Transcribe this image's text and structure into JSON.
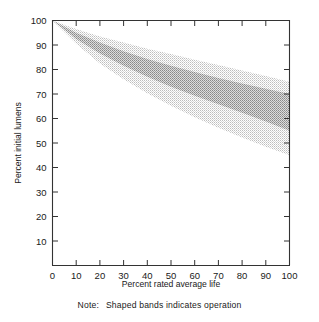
{
  "chart_data": {
    "type": "area",
    "title": "",
    "xlabel": "Percent rated average life",
    "ylabel": "Percent initial lumens",
    "xlim": [
      0,
      100
    ],
    "ylim": [
      0,
      100
    ],
    "xticks": [
      0,
      10,
      20,
      30,
      40,
      50,
      60,
      70,
      80,
      90,
      100
    ],
    "yticks": [
      0,
      10,
      20,
      30,
      40,
      50,
      60,
      70,
      80,
      90,
      100
    ],
    "xtick_labels": [
      "0",
      "10",
      "20",
      "30",
      "40",
      "50",
      "60",
      "70",
      "80",
      "90",
      "100"
    ],
    "ytick_labels": [
      "0",
      "10",
      "20",
      "30",
      "40",
      "50",
      "60",
      "70",
      "80",
      "90",
      "100"
    ],
    "grid": false,
    "legend": "none",
    "x": [
      0,
      10,
      20,
      30,
      40,
      50,
      60,
      70,
      80,
      90,
      100
    ],
    "series": [
      {
        "name": "Outer band upper bound",
        "shade": "light",
        "values": [
          100,
          96.5,
          93.5,
          91.0,
          88.5,
          86.3,
          84.0,
          81.8,
          79.6,
          77.3,
          75.0
        ]
      },
      {
        "name": "Inner band upper bound",
        "shade": "dark",
        "values": [
          100,
          95.0,
          91.0,
          87.5,
          84.3,
          81.5,
          79.0,
          76.5,
          74.3,
          72.1,
          70.0
        ]
      },
      {
        "name": "Inner band lower bound",
        "shade": "dark",
        "values": [
          100,
          92.5,
          86.5,
          81.5,
          77.0,
          73.0,
          69.3,
          65.8,
          62.3,
          58.8,
          55.0
        ]
      },
      {
        "name": "Outer band lower bound",
        "shade": "light",
        "values": [
          100,
          90.5,
          82.5,
          76.0,
          70.3,
          65.2,
          60.5,
          56.2,
          52.2,
          48.5,
          45.0
        ]
      }
    ],
    "annotations": []
  },
  "note": {
    "label": "Note:",
    "text": "Shaped bands indicates operation"
  },
  "colors": {
    "axis": "#333333",
    "text": "#1a1a1a",
    "band_light": "#d6d6d6",
    "band_dark": "#a8a8a8",
    "background": "#ffffff"
  }
}
